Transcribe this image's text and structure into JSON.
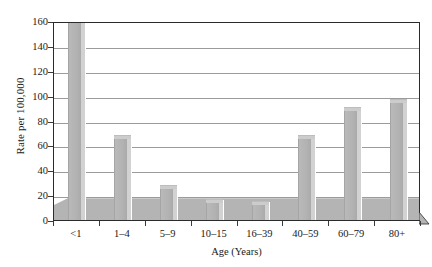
{
  "chart_data": {
    "type": "bar",
    "title": "",
    "subtitle": "",
    "xlabel": "Age (Years)",
    "ylabel": "Rate per 100,000",
    "categories": [
      "<1",
      "1–4",
      "5–9",
      "10–15",
      "16–39",
      "40–59",
      "60–79",
      "80+"
    ],
    "values": [
      155,
      61,
      21,
      10,
      8,
      61,
      84,
      90
    ],
    "series": [
      {
        "name": "Rate per 100,000",
        "values": [
          155,
          61,
          21,
          10,
          8,
          61,
          84,
          90
        ]
      }
    ],
    "ylim": [
      0,
      160
    ],
    "ytick_values": [
      0,
      20,
      40,
      60,
      80,
      100,
      120,
      140,
      160
    ],
    "ytick_labels": [
      "0",
      "20",
      "40",
      "60",
      "80",
      "100",
      "120",
      "140",
      "160"
    ],
    "xlim_categories": 8,
    "grid": {
      "horizontal": true,
      "vertical": false
    },
    "legend": {
      "visible": false,
      "position": "none",
      "entries": []
    },
    "annotations": [],
    "style": {
      "bar_face_color": "#b2b2b2",
      "bar_side_color": "#d2d2d2",
      "bar_top_color": "#cccccc",
      "floor_color": "#b4b4b4",
      "gridline_color": "#9b9b9b",
      "frame_color": "#2b2b2b",
      "background_color": "#ffffff",
      "text_color": "#1a1a1a",
      "three_d": true
    }
  },
  "axes": {
    "y_title": "Rate per 100,000",
    "x_title": "Age (Years)"
  }
}
